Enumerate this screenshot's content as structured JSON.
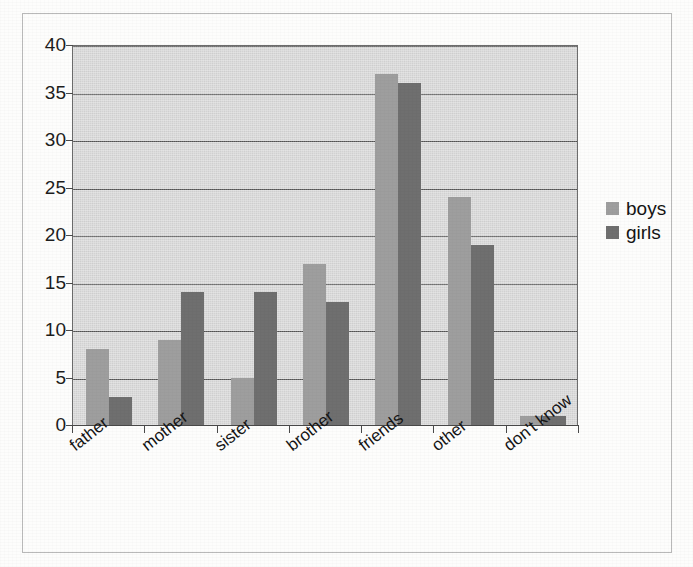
{
  "chart_data": {
    "type": "bar",
    "title": "",
    "subtitle": "",
    "xlabel": "",
    "ylabel": "",
    "categories": [
      "father",
      "mother",
      "sister",
      "brother",
      "friends",
      "other",
      "don't know"
    ],
    "series": [
      {
        "name": "boys",
        "color": "#9e9e9e",
        "values": [
          8,
          9,
          5,
          17,
          37,
          24,
          1
        ]
      },
      {
        "name": "girls",
        "color": "#6f6f6f",
        "values": [
          3,
          14,
          14,
          13,
          36,
          19,
          1
        ]
      }
    ],
    "ylim": [
      0,
      40
    ],
    "ytick_labels": [
      "0",
      "5",
      "10",
      "15",
      "20",
      "25",
      "30",
      "35",
      "40"
    ],
    "ytick_values": [
      0,
      5,
      10,
      15,
      20,
      25,
      30,
      35,
      40
    ],
    "grid": true,
    "grid_axis": "y",
    "legend_position": "right",
    "plot_background": "#d9d9d9",
    "page_background": "#fdfdfc",
    "border_color": "#b9b9b9",
    "xtick_label_rotation": -38
  },
  "legend": {
    "entries": [
      {
        "label": "boys",
        "swatch": "boys-swatch"
      },
      {
        "label": "girls",
        "swatch": "girls-swatch"
      }
    ]
  }
}
